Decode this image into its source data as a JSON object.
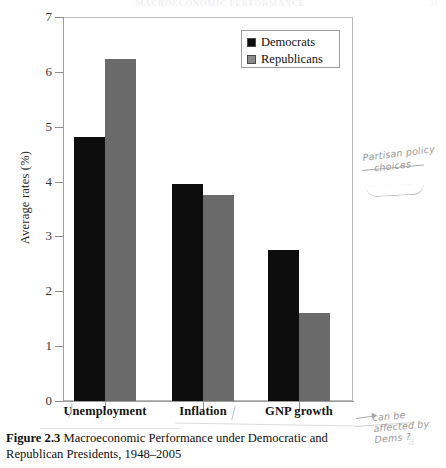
{
  "page": {
    "running_header": "MACROECONOMIC PERFORMANCE",
    "page_number": "31"
  },
  "figure": {
    "caption_label": "Figure 2.3",
    "caption_text": " Macroeconomic Performance under Democratic and Republican Presidents, 1948–2005"
  },
  "legend": {
    "position": "top-right-inside",
    "entries": [
      {
        "label": "Democrats",
        "color": "#0d0d0d"
      },
      {
        "label": "Republicans",
        "color": "#6a6a6a"
      }
    ]
  },
  "axes": {
    "y_title": "Average rates (%)",
    "y_ticks": [
      "0",
      "1",
      "2",
      "3",
      "4",
      "5",
      "6",
      "7"
    ],
    "x_labels": [
      "Unemployment",
      "Inflation",
      "GNP growth"
    ]
  },
  "annotations": {
    "note_1_line_1": "Partisan policy",
    "note_1_line_2": "choices",
    "note_2_line_1": "can be",
    "note_2_line_2": "affected by",
    "note_2_line_3": "Dems ?"
  },
  "chart_data": {
    "type": "bar",
    "title": "Macroeconomic Performance under Democratic and Republican Presidents, 1948–2005",
    "xlabel": "",
    "ylabel": "Average rates (%)",
    "ylim": [
      0,
      7
    ],
    "ytick_step": 1,
    "grid": false,
    "legend_position": "upper right",
    "categories": [
      "Unemployment",
      "Inflation",
      "GNP growth"
    ],
    "series": [
      {
        "name": "Democrats",
        "color": "#0d0d0d",
        "values": [
          4.82,
          3.95,
          2.76
        ]
      },
      {
        "name": "Republicans",
        "color": "#6a6a6a",
        "values": [
          6.24,
          3.76,
          1.61
        ]
      }
    ]
  }
}
